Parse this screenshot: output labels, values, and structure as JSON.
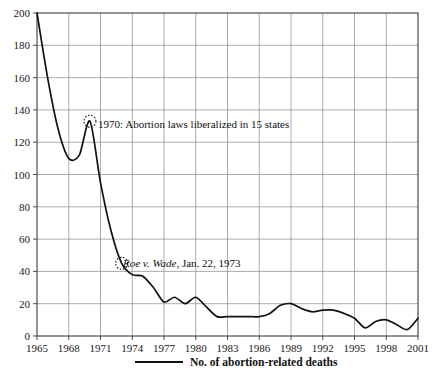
{
  "chart_data": {
    "type": "line",
    "title": "",
    "xlabel": "",
    "ylabel": "",
    "xlim": [
      1965,
      2001
    ],
    "ylim": [
      0,
      200
    ],
    "grid": true,
    "legend_position": "bottom",
    "series": [
      {
        "name": "No. of abortion-related deaths",
        "x": [
          1965,
          1966,
          1967,
          1968,
          1969,
          1970,
          1971,
          1972,
          1973,
          1974,
          1975,
          1976,
          1977,
          1978,
          1979,
          1980,
          1981,
          1982,
          1983,
          1984,
          1985,
          1986,
          1987,
          1988,
          1989,
          1990,
          1991,
          1992,
          1993,
          1994,
          1995,
          1996,
          1997,
          1998,
          1999,
          2000,
          2001
        ],
        "values": [
          200,
          160,
          128,
          110,
          112,
          133,
          95,
          65,
          45,
          38,
          37,
          30,
          21,
          24,
          20,
          24,
          18,
          12,
          12,
          12,
          12,
          12,
          14,
          19,
          20,
          17,
          15,
          16,
          16,
          14,
          11,
          5,
          9,
          10,
          7,
          4,
          11
        ]
      }
    ],
    "x_ticks": [
      1965,
      1968,
      1971,
      1974,
      1977,
      1980,
      1983,
      1986,
      1989,
      1992,
      1995,
      1998,
      2001
    ],
    "y_ticks": [
      0,
      20,
      40,
      60,
      80,
      100,
      120,
      140,
      160,
      180,
      200
    ],
    "annotations": [
      {
        "label": "1970: Abortion laws liberalized in 15 states",
        "italic_prefix": "",
        "x": 1970,
        "y": 133,
        "marker": "dashed-circle"
      },
      {
        "label": ", Jan. 22, 1973",
        "italic_prefix": "Roe v. Wade",
        "x": 1973,
        "y": 45,
        "marker": "dashed-circle"
      }
    ],
    "legend": [
      {
        "label": "No. of abortion-related deaths",
        "color": "#121212"
      }
    ],
    "colors": {
      "series": "#121212",
      "grid": "#8a8a8a",
      "frame": "#3b3b3b",
      "text": "#1a1a1a"
    }
  }
}
